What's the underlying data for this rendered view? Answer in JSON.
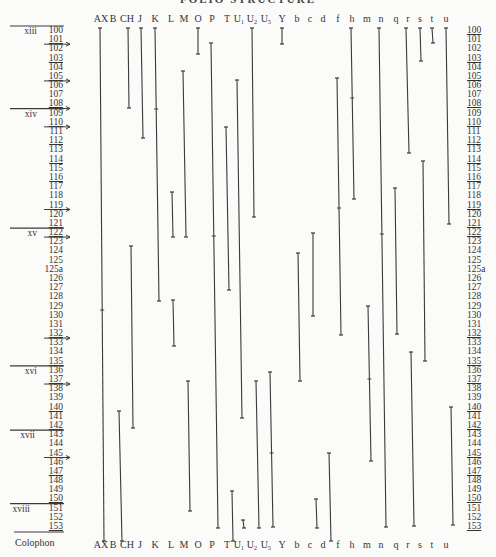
{
  "title": "FOLIO STRUCTURE",
  "columns": [
    {
      "id": "AX",
      "label": "AX",
      "x": 101
    },
    {
      "id": "B",
      "label": "B",
      "x": 113
    },
    {
      "id": "CH",
      "label": "CH",
      "x": 127
    },
    {
      "id": "J",
      "label": "J",
      "x": 140
    },
    {
      "id": "K",
      "label": "K",
      "x": 155
    },
    {
      "id": "L",
      "label": "L",
      "x": 171
    },
    {
      "id": "M",
      "label": "M",
      "x": 184
    },
    {
      "id": "O",
      "label": "O",
      "x": 198
    },
    {
      "id": "P",
      "label": "P",
      "x": 212
    },
    {
      "id": "T",
      "label": "T",
      "x": 227
    },
    {
      "id": "U1",
      "label": "U₁",
      "x": 239
    },
    {
      "id": "U2",
      "label": "U₂",
      "x": 252
    },
    {
      "id": "U5",
      "label": "U₅",
      "x": 266
    },
    {
      "id": "Y",
      "label": "Y",
      "x": 282
    },
    {
      "id": "b",
      "label": "b",
      "x": 297
    },
    {
      "id": "c",
      "label": "c",
      "x": 310
    },
    {
      "id": "d",
      "label": "d",
      "x": 323
    },
    {
      "id": "f",
      "label": "f",
      "x": 338
    },
    {
      "id": "h",
      "label": "h",
      "x": 352
    },
    {
      "id": "m",
      "label": "m",
      "x": 367
    },
    {
      "id": "n",
      "label": "n",
      "x": 381
    },
    {
      "id": "q",
      "label": "q",
      "x": 396
    },
    {
      "id": "r",
      "label": "r",
      "x": 408
    },
    {
      "id": "s",
      "label": "s",
      "x": 420
    },
    {
      "id": "t",
      "label": "t",
      "x": 432
    },
    {
      "id": "u",
      "label": "u",
      "x": 446
    }
  ],
  "rows": [
    "100",
    "101",
    "102",
    "103",
    "104",
    "105",
    "106",
    "107",
    "108",
    "109",
    "110",
    "111",
    "112",
    "113",
    "114",
    "115",
    "116",
    "117",
    "118",
    "119",
    "120",
    "121",
    "122",
    "123",
    "124",
    "125",
    "125a",
    "126",
    "127",
    "128",
    "129",
    "130",
    "131",
    "132",
    "133",
    "134",
    "135",
    "136",
    "137",
    "138",
    "139",
    "140",
    "141",
    "142",
    "143",
    "144",
    "145",
    "146",
    "147",
    "148",
    "149",
    "150",
    "151",
    "152",
    "153"
  ],
  "left_underlined": [
    "101",
    "103",
    "105",
    "108",
    "110",
    "112",
    "114",
    "116",
    "119",
    "121",
    "122",
    "132",
    "135",
    "137",
    "140",
    "142",
    "145",
    "147",
    "150",
    "153"
  ],
  "right_underlined": [
    "100",
    "103",
    "105",
    "108",
    "110",
    "112",
    "114",
    "116",
    "119",
    "121",
    "122",
    "132",
    "135",
    "137",
    "140",
    "142",
    "145",
    "147",
    "150",
    "153"
  ],
  "left_arrows": [
    "101",
    "105",
    "108",
    "110",
    "119",
    "122",
    "132",
    "137",
    "145"
  ],
  "gatherings": [
    {
      "label": "xiii",
      "row": "100"
    },
    {
      "label": "xiv",
      "row": "109"
    },
    {
      "label": "xv",
      "row": "122"
    },
    {
      "label": "xvi",
      "row": "136"
    },
    {
      "label": "xvii",
      "row": "143"
    },
    {
      "label": "xviii",
      "row": "151"
    }
  ],
  "colophon_label": "Colophon",
  "segments": [
    {
      "col": "AX",
      "x1": 100,
      "y1": 28,
      "x2": 104,
      "y2": 541,
      "marks": [
        310
      ]
    },
    {
      "col": "B",
      "x1": 119,
      "y1": 411,
      "x2": 122,
      "y2": 541,
      "marks": []
    },
    {
      "col": "CH",
      "x1": 128,
      "y1": 28,
      "x2": 129,
      "y2": 108,
      "marks": []
    },
    {
      "col": "CH",
      "x1": 131,
      "y1": 246,
      "x2": 133,
      "y2": 428,
      "marks": []
    },
    {
      "col": "J",
      "x1": 141,
      "y1": 28,
      "x2": 143,
      "y2": 138,
      "marks": []
    },
    {
      "col": "K",
      "x1": 155,
      "y1": 28,
      "x2": 159,
      "y2": 301,
      "marks": [
        109
      ]
    },
    {
      "col": "L",
      "x1": 172,
      "y1": 192,
      "x2": 173,
      "y2": 237,
      "marks": []
    },
    {
      "col": "L",
      "x1": 173,
      "y1": 300,
      "x2": 174,
      "y2": 346,
      "marks": []
    },
    {
      "col": "M",
      "x1": 183,
      "y1": 71,
      "x2": 186,
      "y2": 237,
      "marks": []
    },
    {
      "col": "M",
      "x1": 188,
      "y1": 381,
      "x2": 190,
      "y2": 511,
      "marks": []
    },
    {
      "col": "O",
      "x1": 198,
      "y1": 28,
      "x2": 198,
      "y2": 54,
      "marks": []
    },
    {
      "col": "P",
      "x1": 211,
      "y1": 43,
      "x2": 218,
      "y2": 528,
      "marks": [
        236
      ]
    },
    {
      "col": "T",
      "x1": 226,
      "y1": 127,
      "x2": 229,
      "y2": 290,
      "marks": []
    },
    {
      "col": "T",
      "x1": 232,
      "y1": 491,
      "x2": 233,
      "y2": 541,
      "marks": []
    },
    {
      "col": "U1",
      "x1": 237,
      "y1": 80,
      "x2": 242,
      "y2": 418,
      "marks": []
    },
    {
      "col": "U1",
      "x1": 243,
      "y1": 520,
      "x2": 244,
      "y2": 528,
      "marks": []
    },
    {
      "col": "U2",
      "x1": 252,
      "y1": 28,
      "x2": 254,
      "y2": 217,
      "marks": []
    },
    {
      "col": "U2",
      "x1": 256,
      "y1": 381,
      "x2": 259,
      "y2": 528,
      "marks": []
    },
    {
      "col": "U5",
      "x1": 270,
      "y1": 372,
      "x2": 273,
      "y2": 527,
      "marks": [
        453
      ]
    },
    {
      "col": "Y",
      "x1": 282,
      "y1": 28,
      "x2": 282,
      "y2": 44,
      "marks": []
    },
    {
      "col": "Y",
      "x1": 298,
      "y1": 253,
      "x2": 300,
      "y2": 381,
      "marks": []
    },
    {
      "col": "b",
      "x1": 313,
      "y1": 233,
      "x2": 313,
      "y2": 316,
      "marks": []
    },
    {
      "col": "b",
      "x1": 316,
      "y1": 499,
      "x2": 317,
      "y2": 528,
      "marks": []
    },
    {
      "col": "c",
      "x1": 329,
      "y1": 453,
      "x2": 331,
      "y2": 541,
      "marks": []
    },
    {
      "col": "d",
      "x1": 337,
      "y1": 78,
      "x2": 341,
      "y2": 335,
      "marks": [
        208
      ]
    },
    {
      "col": "f",
      "x1": 351,
      "y1": 28,
      "x2": 354,
      "y2": 199,
      "marks": [
        98
      ]
    },
    {
      "col": "h",
      "x1": 368,
      "y1": 306,
      "x2": 371,
      "y2": 461,
      "marks": [
        379
      ]
    },
    {
      "col": "m",
      "x1": 379,
      "y1": 28,
      "x2": 386,
      "y2": 527,
      "marks": [
        234
      ]
    },
    {
      "col": "n",
      "x1": 395,
      "y1": 188,
      "x2": 397,
      "y2": 334,
      "marks": []
    },
    {
      "col": "q",
      "x1": 411,
      "y1": 352,
      "x2": 414,
      "y2": 526,
      "marks": []
    },
    {
      "col": "r",
      "x1": 406,
      "y1": 28,
      "x2": 409,
      "y2": 153,
      "marks": []
    },
    {
      "col": "s",
      "x1": 420,
      "y1": 28,
      "x2": 421,
      "y2": 61,
      "marks": []
    },
    {
      "col": "s",
      "x1": 423,
      "y1": 161,
      "x2": 425,
      "y2": 361,
      "marks": []
    },
    {
      "col": "t",
      "x1": 432,
      "y1": 28,
      "x2": 433,
      "y2": 43,
      "marks": []
    },
    {
      "col": "u",
      "x1": 446,
      "y1": 28,
      "x2": 449,
      "y2": 224,
      "marks": []
    },
    {
      "col": "u",
      "x1": 451,
      "y1": 407,
      "x2": 453,
      "y2": 525,
      "marks": []
    }
  ],
  "colors": {
    "ink": "#2a2a2a",
    "paper": "#fbfbfa",
    "line": "#3a3a3a"
  }
}
